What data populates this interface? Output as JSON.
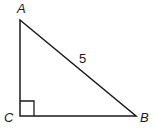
{
  "diagram": {
    "type": "right-triangle",
    "vertices": {
      "A": {
        "label": "A",
        "x": 20,
        "y": 20
      },
      "B": {
        "label": "B",
        "x": 136,
        "y": 116
      },
      "C": {
        "label": "C",
        "x": 20,
        "y": 116
      }
    },
    "right_angle_at": "C",
    "sides": {
      "AB": {
        "label": "5"
      }
    },
    "colors": {
      "stroke": "#1a1a1a",
      "background": "#ffffff"
    }
  }
}
